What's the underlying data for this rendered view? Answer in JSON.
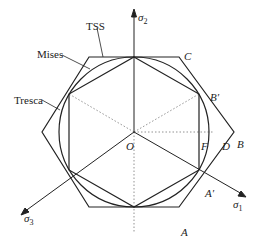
{
  "diagram": {
    "type": "yield-criteria-pi-plane",
    "curves": [
      {
        "name": "TSS",
        "label": "TSS",
        "shape": "outer hexagon"
      },
      {
        "name": "Mises",
        "label": "Mises",
        "shape": "circle"
      },
      {
        "name": "Tresca",
        "label": "Tresca",
        "shape": "inner hexagon"
      }
    ],
    "axes": {
      "sigma2": {
        "symbol": "σ",
        "subscript": "2"
      },
      "sigma1": {
        "symbol": "σ",
        "subscript": "1"
      },
      "sigma3": {
        "symbol": "σ",
        "subscript": "3"
      }
    },
    "points": {
      "origin": "O",
      "A": "A",
      "A_prime": "A′",
      "B": "B",
      "B_prime": "B′",
      "C": "C",
      "D": "D",
      "F": "F"
    },
    "colors": {
      "line": "#222222",
      "dotted": "#777777",
      "background": "#ffffff"
    }
  }
}
